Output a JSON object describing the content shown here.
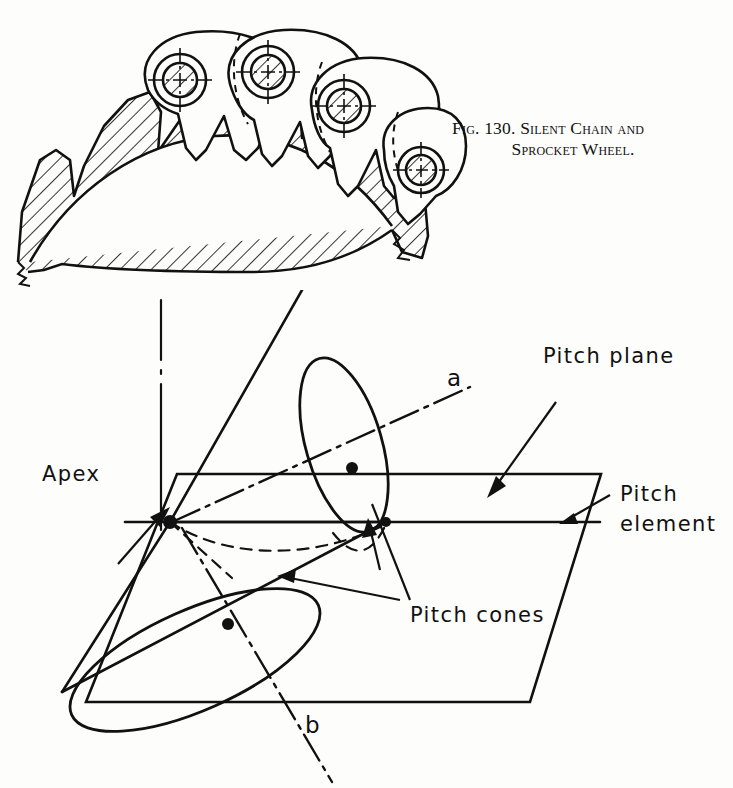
{
  "figure_top": {
    "name": "silent-chain-sprocket-illustration",
    "caption_line1": "Fig. 130. Silent Chain and",
    "caption_line2": "Sprocket Wheel.",
    "caption_full": "FIG. 130. SILENT CHAIN AND SPROCKET WHEEL.",
    "elements": [
      "hatched sprocket wheel rim with teeth",
      "silent chain links",
      "chain pin circles with crosshair centerlines"
    ]
  },
  "figure_bottom": {
    "name": "pitch-cones-diagram",
    "labels": {
      "pitch_plane": "Pitch plane",
      "pitch_element_line1": "Pitch",
      "pitch_element_line2": "element",
      "apex": "Apex",
      "pitch_cones": "Pitch cones",
      "axis_a": "a",
      "axis_b": "b"
    }
  },
  "style": {
    "ink": "#111111",
    "paper": "#fdfdfb",
    "line_weight": "2"
  }
}
